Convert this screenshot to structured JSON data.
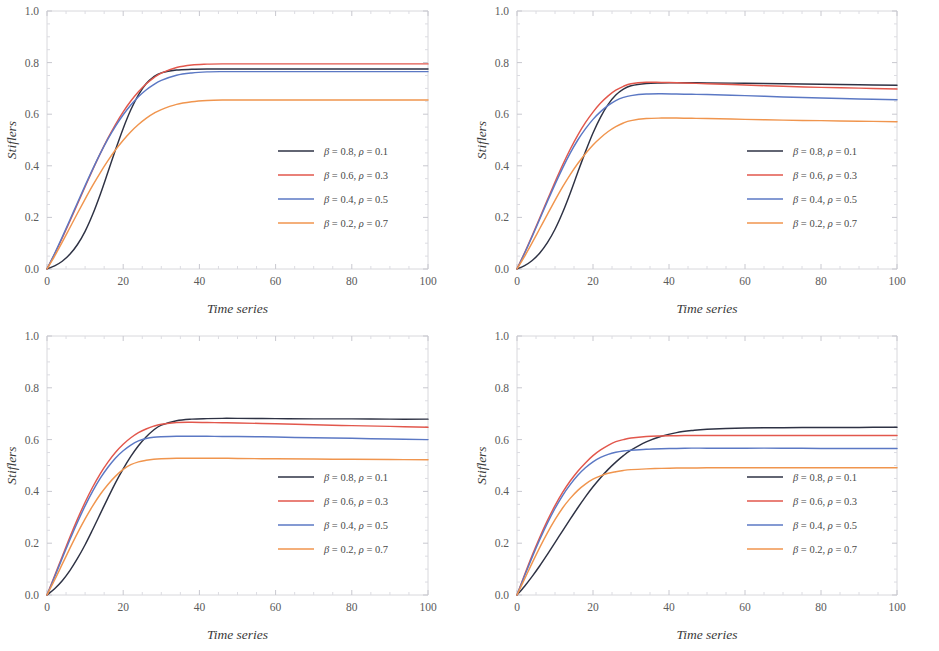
{
  "figure": {
    "panel_count": 4,
    "background_color": "#ffffff",
    "frame_color": "#d8d8dc"
  },
  "series_styles": {
    "colors": [
      "#2e3244",
      "#e2574c",
      "#5b78c4",
      "#f0954e"
    ],
    "labels": [
      "β = 0.8, ρ = 0.1",
      "β = 0.6, ρ = 0.3",
      "β = 0.4, ρ = 0.5",
      "β = 0.2, ρ = 0.7"
    ]
  },
  "chart_data": [
    {
      "type": "line",
      "panel": "top-left",
      "title": "",
      "xlabel": "Time series",
      "ylabel": "Stiflers",
      "xlim": [
        0,
        100
      ],
      "ylim": [
        0.0,
        1.0
      ],
      "xticks": [
        0,
        20,
        40,
        60,
        80,
        100
      ],
      "xtick_labels": [
        "0",
        "20",
        "40",
        "60",
        "80",
        "100"
      ],
      "yticks": [
        0.0,
        0.2,
        0.4,
        0.6,
        0.8,
        1.0
      ],
      "ytick_labels": [
        "0.0",
        "0.2",
        "0.4",
        "0.6",
        "0.8",
        "1.0"
      ],
      "grid": false,
      "legend_position": "lower-right",
      "x": [
        0,
        2,
        4,
        6,
        8,
        10,
        12,
        14,
        16,
        18,
        20,
        22,
        24,
        26,
        28,
        30,
        34,
        38,
        42,
        46,
        50,
        60,
        70,
        80,
        90,
        100
      ],
      "series": [
        {
          "name": "β = 0.8, ρ = 0.1",
          "color": "#2e3244",
          "values": [
            0.0,
            0.012,
            0.03,
            0.057,
            0.095,
            0.146,
            0.212,
            0.29,
            0.376,
            0.463,
            0.545,
            0.617,
            0.675,
            0.718,
            0.745,
            0.76,
            0.771,
            0.774,
            0.775,
            0.775,
            0.775,
            0.775,
            0.775,
            0.775,
            0.775,
            0.775
          ]
        },
        {
          "name": "β = 0.6, ρ = 0.3",
          "color": "#e2574c",
          "values": [
            0.0,
            0.058,
            0.12,
            0.185,
            0.252,
            0.319,
            0.385,
            0.448,
            0.507,
            0.561,
            0.609,
            0.651,
            0.687,
            0.717,
            0.741,
            0.759,
            0.781,
            0.791,
            0.794,
            0.795,
            0.795,
            0.795,
            0.795,
            0.795,
            0.795,
            0.795
          ]
        },
        {
          "name": "β = 0.4, ρ = 0.5",
          "color": "#5b78c4",
          "values": [
            0.0,
            0.06,
            0.124,
            0.19,
            0.257,
            0.323,
            0.387,
            0.448,
            0.504,
            0.554,
            0.598,
            0.636,
            0.668,
            0.694,
            0.715,
            0.731,
            0.751,
            0.76,
            0.764,
            0.765,
            0.765,
            0.765,
            0.765,
            0.765,
            0.765,
            0.765
          ]
        },
        {
          "name": "β = 0.2, ρ = 0.7",
          "color": "#f0954e",
          "values": [
            0.0,
            0.05,
            0.104,
            0.16,
            0.216,
            0.271,
            0.324,
            0.374,
            0.42,
            0.462,
            0.499,
            0.532,
            0.56,
            0.584,
            0.603,
            0.618,
            0.638,
            0.648,
            0.653,
            0.655,
            0.655,
            0.655,
            0.655,
            0.655,
            0.655,
            0.655
          ]
        }
      ]
    },
    {
      "type": "line",
      "panel": "top-right",
      "title": "",
      "xlabel": "Time series",
      "ylabel": "Stiflers",
      "xlim": [
        0,
        100
      ],
      "ylim": [
        0.0,
        1.0
      ],
      "xticks": [
        0,
        20,
        40,
        60,
        80,
        100
      ],
      "xtick_labels": [
        "0",
        "20",
        "40",
        "60",
        "80",
        "100"
      ],
      "yticks": [
        0.0,
        0.2,
        0.4,
        0.6,
        0.8,
        1.0
      ],
      "ytick_labels": [
        "0.0",
        "0.2",
        "0.4",
        "0.6",
        "0.8",
        "1.0"
      ],
      "grid": false,
      "legend_position": "lower-right",
      "x": [
        0,
        2,
        4,
        6,
        8,
        10,
        12,
        14,
        16,
        18,
        20,
        22,
        24,
        26,
        28,
        30,
        34,
        38,
        42,
        46,
        50,
        60,
        70,
        80,
        90,
        100
      ],
      "series": [
        {
          "name": "β = 0.8, ρ = 0.1",
          "color": "#2e3244",
          "values": [
            0.0,
            0.013,
            0.033,
            0.062,
            0.102,
            0.154,
            0.219,
            0.294,
            0.375,
            0.454,
            0.527,
            0.589,
            0.638,
            0.674,
            0.697,
            0.71,
            0.719,
            0.721,
            0.722,
            0.722,
            0.721,
            0.72,
            0.718,
            0.716,
            0.714,
            0.712
          ]
        },
        {
          "name": "β = 0.6, ρ = 0.3",
          "color": "#e2574c",
          "values": [
            0.0,
            0.063,
            0.13,
            0.199,
            0.268,
            0.337,
            0.403,
            0.464,
            0.519,
            0.567,
            0.608,
            0.643,
            0.671,
            0.693,
            0.708,
            0.718,
            0.724,
            0.723,
            0.722,
            0.72,
            0.718,
            0.713,
            0.708,
            0.704,
            0.701,
            0.698
          ]
        },
        {
          "name": "β = 0.4, ρ = 0.5",
          "color": "#5b78c4",
          "values": [
            0.0,
            0.061,
            0.126,
            0.194,
            0.262,
            0.328,
            0.391,
            0.449,
            0.5,
            0.543,
            0.58,
            0.61,
            0.634,
            0.653,
            0.665,
            0.672,
            0.678,
            0.679,
            0.678,
            0.677,
            0.676,
            0.672,
            0.667,
            0.663,
            0.659,
            0.656
          ]
        },
        {
          "name": "β = 0.2, ρ = 0.7",
          "color": "#f0954e",
          "values": [
            0.0,
            0.049,
            0.102,
            0.157,
            0.212,
            0.266,
            0.318,
            0.366,
            0.409,
            0.447,
            0.481,
            0.509,
            0.533,
            0.552,
            0.566,
            0.575,
            0.583,
            0.585,
            0.585,
            0.584,
            0.583,
            0.58,
            0.577,
            0.575,
            0.573,
            0.571
          ]
        }
      ]
    },
    {
      "type": "line",
      "panel": "bottom-left",
      "title": "",
      "xlabel": "Time series",
      "ylabel": "Stiflers",
      "xlim": [
        0,
        100
      ],
      "ylim": [
        0.0,
        1.0
      ],
      "xticks": [
        0,
        20,
        40,
        60,
        80,
        100
      ],
      "xtick_labels": [
        "0",
        "20",
        "40",
        "60",
        "80",
        "100"
      ],
      "yticks": [
        0.0,
        0.2,
        0.4,
        0.6,
        0.8,
        1.0
      ],
      "ytick_labels": [
        "0.0",
        "0.2",
        "0.4",
        "0.6",
        "0.8",
        "1.0"
      ],
      "grid": false,
      "legend_position": "lower-right",
      "x": [
        0,
        2,
        4,
        6,
        8,
        10,
        12,
        14,
        16,
        18,
        20,
        22,
        24,
        26,
        28,
        30,
        34,
        38,
        42,
        46,
        50,
        60,
        70,
        80,
        90,
        100
      ],
      "series": [
        {
          "name": "β = 0.8, ρ = 0.1",
          "color": "#2e3244",
          "values": [
            0.0,
            0.024,
            0.055,
            0.094,
            0.141,
            0.194,
            0.253,
            0.314,
            0.375,
            0.434,
            0.487,
            0.535,
            0.576,
            0.61,
            0.637,
            0.656,
            0.673,
            0.679,
            0.681,
            0.682,
            0.682,
            0.681,
            0.68,
            0.68,
            0.679,
            0.679
          ]
        },
        {
          "name": "β = 0.6, ρ = 0.3",
          "color": "#e2574c",
          "values": [
            0.0,
            0.074,
            0.149,
            0.223,
            0.293,
            0.358,
            0.417,
            0.469,
            0.513,
            0.551,
            0.582,
            0.607,
            0.627,
            0.641,
            0.652,
            0.659,
            0.666,
            0.667,
            0.666,
            0.665,
            0.664,
            0.661,
            0.657,
            0.654,
            0.651,
            0.648
          ]
        },
        {
          "name": "β = 0.4, ρ = 0.5",
          "color": "#5b78c4",
          "values": [
            0.0,
            0.07,
            0.142,
            0.213,
            0.281,
            0.344,
            0.401,
            0.451,
            0.493,
            0.529,
            0.557,
            0.579,
            0.595,
            0.604,
            0.609,
            0.611,
            0.613,
            0.613,
            0.613,
            0.612,
            0.612,
            0.61,
            0.607,
            0.605,
            0.602,
            0.6
          ]
        },
        {
          "name": "β = 0.2, ρ = 0.7",
          "color": "#f0954e",
          "values": [
            0.0,
            0.058,
            0.119,
            0.18,
            0.239,
            0.294,
            0.344,
            0.389,
            0.427,
            0.459,
            0.485,
            0.503,
            0.514,
            0.52,
            0.524,
            0.526,
            0.528,
            0.528,
            0.528,
            0.528,
            0.527,
            0.526,
            0.525,
            0.524,
            0.523,
            0.522
          ]
        }
      ]
    },
    {
      "type": "line",
      "panel": "bottom-right",
      "title": "",
      "xlabel": "Time series",
      "ylabel": "Stiflers",
      "xlim": [
        0,
        100
      ],
      "ylim": [
        0.0,
        1.0
      ],
      "xticks": [
        0,
        20,
        40,
        60,
        80,
        100
      ],
      "xtick_labels": [
        "0",
        "20",
        "40",
        "60",
        "80",
        "100"
      ],
      "yticks": [
        0.0,
        0.2,
        0.4,
        0.6,
        0.8,
        1.0
      ],
      "ytick_labels": [
        "0.0",
        "0.2",
        "0.4",
        "0.6",
        "0.8",
        "1.0"
      ],
      "grid": false,
      "legend_position": "lower-right",
      "x": [
        0,
        2,
        4,
        6,
        8,
        10,
        12,
        14,
        16,
        18,
        20,
        22,
        24,
        26,
        28,
        30,
        34,
        38,
        42,
        46,
        50,
        60,
        70,
        80,
        90,
        100
      ],
      "series": [
        {
          "name": "β = 0.8, ρ = 0.1",
          "color": "#2e3244",
          "values": [
            0.0,
            0.034,
            0.072,
            0.113,
            0.157,
            0.202,
            0.248,
            0.293,
            0.337,
            0.379,
            0.418,
            0.453,
            0.485,
            0.513,
            0.538,
            0.559,
            0.591,
            0.613,
            0.627,
            0.635,
            0.64,
            0.645,
            0.646,
            0.647,
            0.647,
            0.648
          ]
        },
        {
          "name": "β = 0.6, ρ = 0.3",
          "color": "#e2574c",
          "values": [
            0.0,
            0.078,
            0.153,
            0.223,
            0.287,
            0.345,
            0.396,
            0.44,
            0.478,
            0.51,
            0.538,
            0.56,
            0.578,
            0.592,
            0.6,
            0.606,
            0.612,
            0.614,
            0.615,
            0.616,
            0.616,
            0.616,
            0.616,
            0.616,
            0.616,
            0.616
          ]
        },
        {
          "name": "β = 0.4, ρ = 0.5",
          "color": "#5b78c4",
          "values": [
            0.0,
            0.074,
            0.146,
            0.214,
            0.277,
            0.334,
            0.384,
            0.426,
            0.462,
            0.491,
            0.514,
            0.531,
            0.543,
            0.551,
            0.556,
            0.559,
            0.563,
            0.565,
            0.566,
            0.567,
            0.567,
            0.567,
            0.567,
            0.566,
            0.566,
            0.566
          ]
        },
        {
          "name": "β = 0.2, ρ = 0.7",
          "color": "#f0954e",
          "values": [
            0.0,
            0.062,
            0.124,
            0.184,
            0.24,
            0.291,
            0.336,
            0.373,
            0.404,
            0.428,
            0.447,
            0.46,
            0.47,
            0.476,
            0.481,
            0.484,
            0.487,
            0.489,
            0.49,
            0.49,
            0.491,
            0.491,
            0.491,
            0.491,
            0.491,
            0.491
          ]
        }
      ]
    }
  ]
}
